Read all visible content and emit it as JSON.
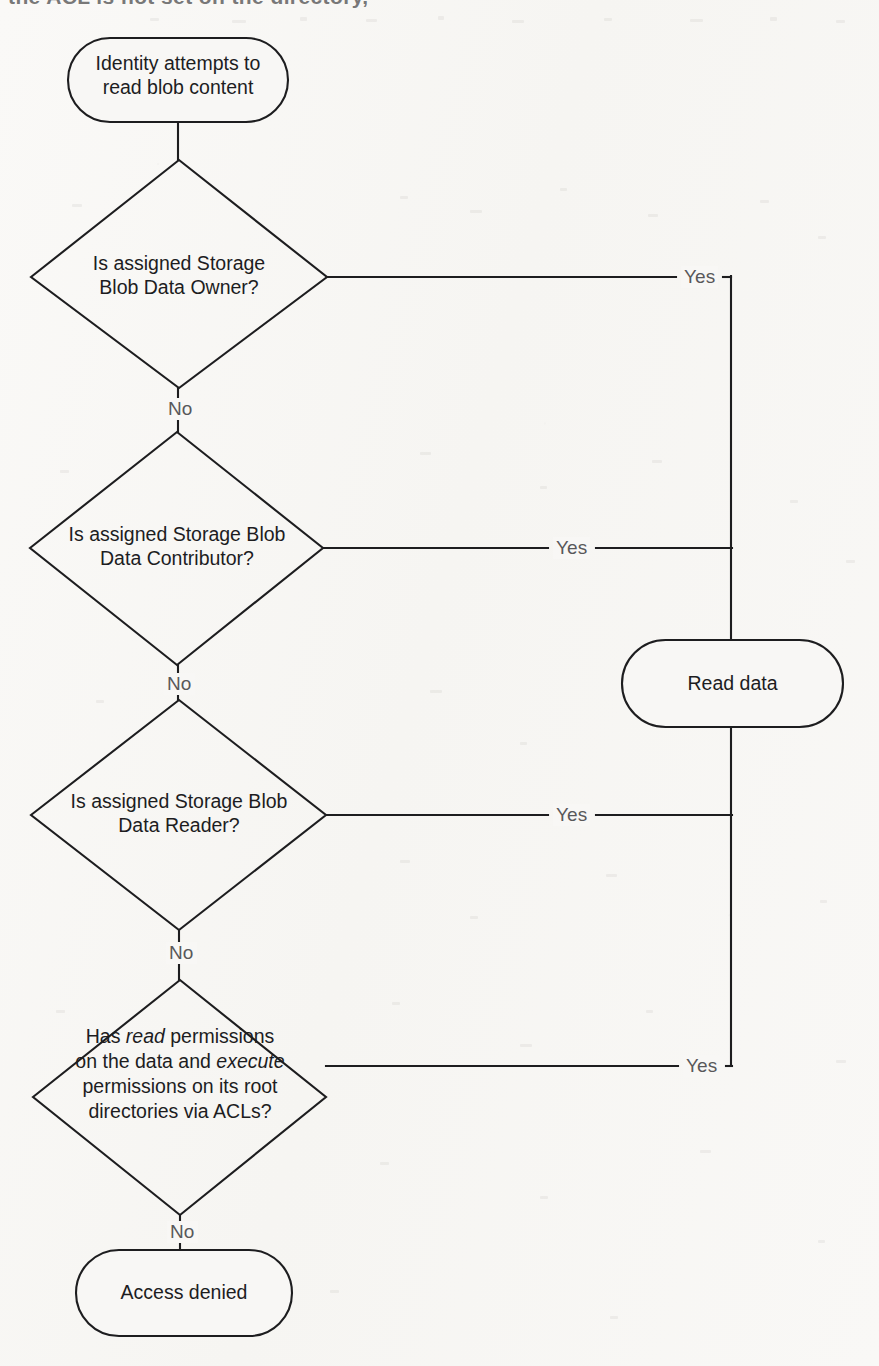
{
  "page": {
    "background_color": "#f8f7f5",
    "stroke_color": "#1d1d1f",
    "label_color": "#58585a",
    "cropped_header_text": "the  ACL  is  not  set  on  the  directory,"
  },
  "diagram": {
    "type": "flowchart",
    "nodes": [
      {
        "id": "start",
        "shape": "stadium",
        "label": "Identity attempts to\nread blob content",
        "x": 68,
        "y": 38,
        "w": 220,
        "h": 84
      },
      {
        "id": "d1",
        "shape": "diamond",
        "label": "Is assigned Storage\nBlob Data Owner?",
        "cx": 179,
        "cy": 277,
        "w": 296,
        "h": 228
      },
      {
        "id": "d2",
        "shape": "diamond",
        "label": "Is assigned Storage Blob\nData Contributor?",
        "cx": 177,
        "cy": 548,
        "w": 293,
        "h": 233
      },
      {
        "id": "d3",
        "shape": "diamond",
        "label": "Is assigned Storage Blob\nData Reader?",
        "cx": 179,
        "cy": 815,
        "w": 295,
        "h": 230
      },
      {
        "id": "d4",
        "shape": "diamond",
        "label_runs": [
          {
            "t": "Has ",
            "i": false
          },
          {
            "t": "read",
            "i": true
          },
          {
            "t": " permissions\non the data and ",
            "i": false
          },
          {
            "t": "execute",
            "i": true
          },
          {
            "t": "\npermissions on its root\ndirectories via ACLs?",
            "i": false
          }
        ],
        "cx": 180,
        "cy": 1097,
        "w": 293,
        "h": 235
      },
      {
        "id": "read",
        "shape": "stadium",
        "label": "Read data",
        "x": 622,
        "y": 640,
        "w": 221,
        "h": 87
      },
      {
        "id": "denied",
        "shape": "stadium",
        "label": "Access denied",
        "x": 76,
        "y": 1250,
        "w": 216,
        "h": 86
      }
    ],
    "edges": [
      {
        "from": "start",
        "to": "d1",
        "label": "",
        "direction": "down"
      },
      {
        "from": "d1",
        "to": "read",
        "label": "Yes",
        "direction": "right",
        "label_x": 700,
        "label_y": 277
      },
      {
        "from": "d1",
        "to": "d2",
        "label": "No",
        "direction": "down",
        "label_x": 179,
        "label_y": 410
      },
      {
        "from": "d2",
        "to": "read",
        "label": "Yes",
        "direction": "right",
        "label_x": 572,
        "label_y": 548
      },
      {
        "from": "d2",
        "to": "d3",
        "label": "No",
        "direction": "down",
        "label_x": 177,
        "label_y": 686
      },
      {
        "from": "d3",
        "to": "read",
        "label": "Yes",
        "direction": "right",
        "label_x": 572,
        "label_y": 815
      },
      {
        "from": "d3",
        "to": "d4",
        "label": "No",
        "direction": "down",
        "label_x": 179,
        "label_y": 954
      },
      {
        "from": "d4",
        "to": "read",
        "label": "Yes",
        "direction": "right",
        "label_x": 702,
        "label_y": 1066
      },
      {
        "from": "d4",
        "to": "denied",
        "label": "No",
        "direction": "down",
        "label_x": 180,
        "label_y": 1233
      }
    ],
    "connector_rail_x": 731,
    "labels": {
      "yes": "Yes",
      "no": "No"
    }
  }
}
